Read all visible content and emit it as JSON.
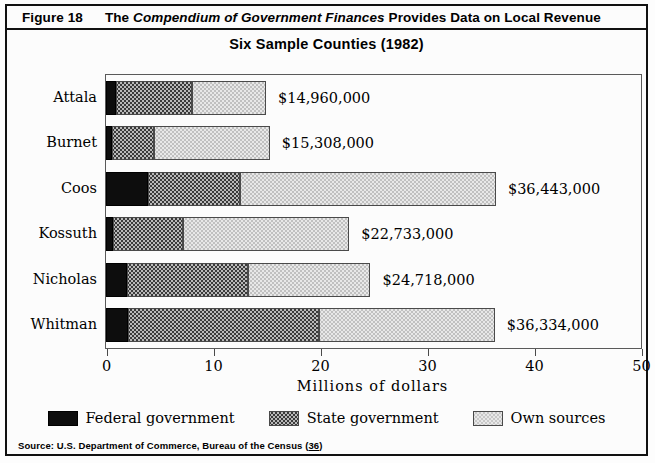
{
  "header": {
    "figure_number": "Figure 18",
    "title_part1": "The ",
    "title_italic": "Compendium of Government Finances",
    "title_part2": " Provides Data on Local Revenue"
  },
  "subtitle": "Six Sample Counties (1982)",
  "source_note": {
    "text_before": "Source: U.S. Department of Commerce, Bureau of the Census (",
    "reference": "36",
    "text_after": ")"
  },
  "colors": {
    "federal": "#0d0d0d",
    "state": "#b9b9b9",
    "own": "#e8e8e8",
    "frame": "#111111",
    "axis": "#5a5a5a"
  },
  "chart_data": {
    "type": "bar",
    "orientation": "horizontal",
    "stacked": true,
    "title": "Six Sample Counties (1982)",
    "xlabel": "Millions of dollars",
    "ylabel": "",
    "xlim": [
      0,
      50
    ],
    "xticks": [
      0,
      10,
      20,
      30,
      40,
      50
    ],
    "xtick_labels": [
      "0",
      "10",
      "20",
      "30",
      "40",
      "50"
    ],
    "grid": false,
    "legend_position": "bottom",
    "categories": [
      "Attala",
      "Burnet",
      "Coos",
      "Kossuth",
      "Nicholas",
      "Whitman"
    ],
    "series": [
      {
        "name": "Federal government",
        "values": [
          0.9,
          0.6,
          3.9,
          0.7,
          2.0,
          2.1
        ]
      },
      {
        "name": "State government",
        "values": [
          7.1,
          3.9,
          8.6,
          6.5,
          11.3,
          17.8
        ]
      },
      {
        "name": "Own sources",
        "values": [
          6.96,
          10.81,
          23.94,
          15.53,
          11.42,
          16.43
        ]
      }
    ],
    "totals": [
      14.96,
      15.308,
      36.443,
      22.733,
      24.718,
      36.334
    ],
    "value_labels": [
      "$14,960,000",
      "$15,308,000",
      "$36,443,000",
      "$22,733,000",
      "$24,718,000",
      "$36,334,000"
    ]
  }
}
